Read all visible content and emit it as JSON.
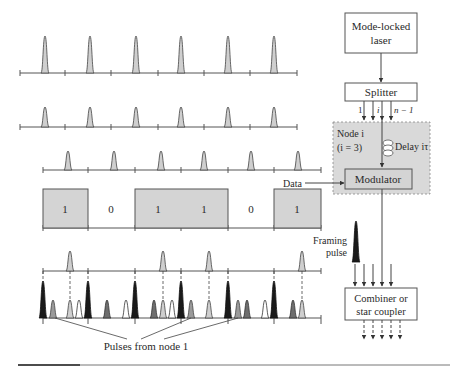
{
  "diagram": {
    "title_blocks": {
      "laser": [
        "Mode-locked",
        "laser"
      ],
      "splitter": "Splitter",
      "splitter_ports": {
        "first": "1",
        "middle": "i",
        "last": "n − 1"
      },
      "node": [
        "Node i",
        "(i = 3)"
      ],
      "delay": "Delay iτ",
      "modulator": "Modulator",
      "data_input": "Data",
      "framing": [
        "Framing",
        "pulse"
      ],
      "combiner": [
        "Combiner or",
        "star coupler"
      ],
      "pulses_from_node": "Pulses from node 1"
    },
    "data_bits": [
      "1",
      "0",
      "1",
      "1",
      "0",
      "1"
    ],
    "colors": {
      "pulse_light": "#cfcfcf",
      "pulse_mid": "#8a8a8a",
      "pulse_dark": "#1a1a1a",
      "node_box_fill": "#d9d9d9",
      "box_fill": "#d4d4d4",
      "line": "#555555"
    }
  }
}
